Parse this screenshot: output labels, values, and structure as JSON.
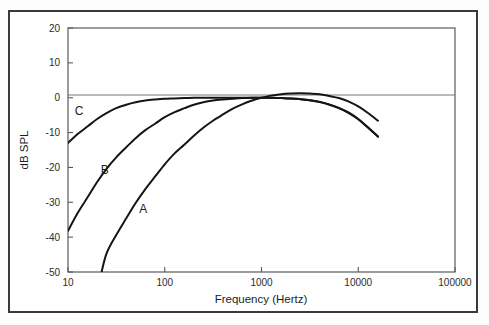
{
  "chart_data": {
    "type": "line",
    "title": "",
    "xlabel": "Frequency (Hertz)",
    "ylabel": "dB SPL",
    "xscale": "log",
    "xlim": [
      10,
      100000
    ],
    "ylim": [
      -50,
      20
    ],
    "xticks": [
      10,
      100,
      1000,
      10000,
      100000
    ],
    "xtick_labels": [
      "10",
      "100",
      "1000",
      "10000",
      "100000"
    ],
    "yticks": [
      20,
      10,
      0,
      -10,
      -20,
      -30,
      -40,
      -50
    ],
    "ytick_labels": [
      "20",
      "10",
      "0",
      "-10",
      "-20",
      "-30",
      "-40",
      "-50"
    ],
    "grid": false,
    "legend": "inline-curve-labels",
    "zero_reference_line": true,
    "series": [
      {
        "name": "A",
        "label": "A",
        "label_x": 60,
        "label_y": -33,
        "color": "#151515",
        "x": [
          22,
          25,
          31.5,
          40,
          50,
          63,
          80,
          100,
          125,
          160,
          200,
          250,
          315,
          400,
          500,
          630,
          800,
          1000,
          1250,
          1600,
          2000,
          2500,
          3150,
          4000,
          5000,
          6300,
          8000,
          10000,
          12500,
          16000
        ],
        "y": [
          -50.5,
          -44.7,
          -39.4,
          -34.6,
          -30.2,
          -26.2,
          -22.5,
          -19.1,
          -16.1,
          -13.4,
          -10.9,
          -8.6,
          -6.6,
          -4.8,
          -3.2,
          -1.9,
          -0.8,
          0.0,
          0.6,
          1.0,
          1.2,
          1.3,
          1.2,
          1.0,
          0.5,
          -0.1,
          -1.1,
          -2.5,
          -4.3,
          -6.6
        ]
      },
      {
        "name": "B",
        "label": "B",
        "label_x": 24,
        "label_y": -22,
        "color": "#151515",
        "x": [
          10,
          12.5,
          16,
          20,
          25,
          31.5,
          40,
          50,
          63,
          80,
          100,
          125,
          160,
          200,
          250,
          315,
          400,
          500,
          630,
          800,
          1000,
          1250,
          1600,
          2000,
          2500,
          3150,
          4000,
          5000,
          6300,
          8000,
          10000,
          12500,
          16000
        ],
        "y": [
          -38.2,
          -33.2,
          -28.5,
          -24.2,
          -20.4,
          -17.1,
          -14.2,
          -11.6,
          -9.3,
          -7.4,
          -5.6,
          -4.2,
          -3.0,
          -2.0,
          -1.3,
          -0.8,
          -0.5,
          -0.3,
          -0.1,
          0.0,
          0.0,
          0.0,
          -0.1,
          -0.2,
          -0.4,
          -0.7,
          -1.2,
          -1.9,
          -2.9,
          -4.3,
          -6.1,
          -8.4,
          -11.1
        ]
      },
      {
        "name": "C",
        "label": "C",
        "label_x": 13,
        "label_y": -5,
        "color": "#151515",
        "x": [
          10,
          12.5,
          16,
          20,
          25,
          31.5,
          40,
          50,
          63,
          80,
          100,
          125,
          160,
          200,
          250,
          315,
          400,
          500,
          630,
          800,
          1000,
          1250,
          1600,
          2000,
          2500,
          3150,
          4000,
          5000,
          6300,
          8000,
          10000,
          12500,
          16000
        ],
        "y": [
          -13.0,
          -10.5,
          -8.2,
          -6.1,
          -4.4,
          -3.0,
          -2.0,
          -1.3,
          -0.8,
          -0.5,
          -0.3,
          -0.2,
          -0.1,
          0.0,
          0.0,
          0.0,
          0.0,
          0.0,
          0.0,
          0.0,
          0.0,
          0.0,
          -0.1,
          -0.2,
          -0.4,
          -0.7,
          -1.2,
          -2.0,
          -3.0,
          -4.4,
          -6.2,
          -8.5,
          -11.2
        ]
      }
    ]
  },
  "figure": {
    "axis_color": "#5a5a5a",
    "curve_color": "#151515",
    "frame_color": "#3a3a3a",
    "background": "#ffffff"
  }
}
